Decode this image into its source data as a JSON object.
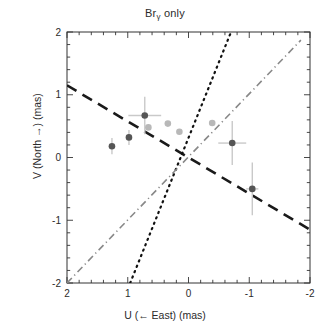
{
  "chart_data": {
    "type": "scatter",
    "title": "Brγ only",
    "title_main": "Br",
    "title_sub": "γ",
    "title_tail": " only",
    "xlabel": "U (← East) (mas)",
    "ylabel": "V (North →) (mas)",
    "xlim": [
      2,
      -2
    ],
    "ylim": [
      -2,
      2
    ],
    "x_reversed": true,
    "xticks": [
      2,
      1,
      0,
      -1,
      -2
    ],
    "xtick_labels": [
      "2",
      "1",
      "0",
      "-1",
      "-2"
    ],
    "yticks": [
      -2,
      -1,
      0,
      1,
      2
    ],
    "ytick_labels": [
      "-2",
      "-1",
      "0",
      "1",
      "2"
    ],
    "minor_tick_step": 0.2,
    "grid": false,
    "legend": "none",
    "frame": true,
    "series": [
      {
        "name": "measured positions (with error bars)",
        "type": "scatter",
        "marker": "circle",
        "color": "#555555",
        "points": [
          {
            "x": 1.26,
            "y": 0.18,
            "xerr": 0.0,
            "yerr": 0.13
          },
          {
            "x": 0.98,
            "y": 0.32,
            "xerr": 0.0,
            "yerr": 0.12
          },
          {
            "x": 0.72,
            "y": 0.67,
            "xerr": 0.27,
            "yerr": 0.3
          },
          {
            "x": -0.72,
            "y": 0.23,
            "xerr": 0.23,
            "yerr": 0.35
          },
          {
            "x": -1.05,
            "y": -0.5,
            "xerr": 0.1,
            "yerr": 0.42
          }
        ]
      },
      {
        "name": "faint positions (no error bars)",
        "type": "scatter",
        "marker": "circle",
        "color": "#b8b8b8",
        "points": [
          {
            "x": 0.66,
            "y": 0.48
          },
          {
            "x": 0.34,
            "y": 0.54
          },
          {
            "x": 0.15,
            "y": 0.41
          },
          {
            "x": -0.39,
            "y": 0.55
          }
        ]
      }
    ],
    "lines": [
      {
        "name": "dashed fit line",
        "style": "dashed",
        "color": "#1a1a1a",
        "width": 2.6,
        "x1": 2.0,
        "y1": 1.15,
        "x2": -2.0,
        "y2": -1.15
      },
      {
        "name": "dotted line",
        "style": "dotted",
        "color": "#111111",
        "width": 2.2,
        "x1": 0.96,
        "y1": -2.0,
        "x2": -0.7,
        "y2": 2.0
      },
      {
        "name": "dash-dot line",
        "style": "dashdot",
        "color": "#888888",
        "width": 1.6,
        "x1": 2.0,
        "y1": -2.0,
        "x2": -1.85,
        "y2": 1.87
      }
    ]
  },
  "axes": {
    "plot_left_px": 67,
    "plot_right_px": 310,
    "plot_top_px": 32,
    "plot_bottom_px": 283
  }
}
